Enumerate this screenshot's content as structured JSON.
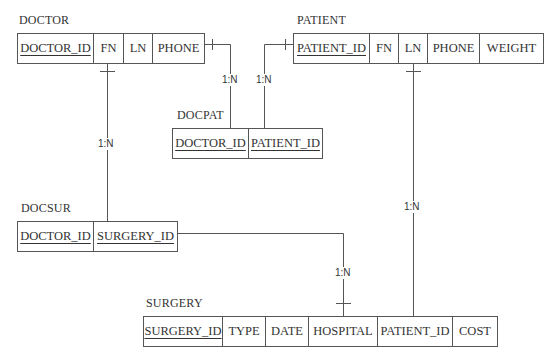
{
  "diagram": {
    "type": "relational-schema",
    "tables": {
      "doctor": {
        "name": "DOCTOR",
        "columns": [
          {
            "label": "DOCTOR_ID",
            "pk": true
          },
          {
            "label": "FN",
            "pk": false
          },
          {
            "label": "LN",
            "pk": false
          },
          {
            "label": "PHONE",
            "pk": false
          }
        ]
      },
      "patient": {
        "name": "PATIENT",
        "columns": [
          {
            "label": "PATIENT_ID",
            "pk": true
          },
          {
            "label": "FN",
            "pk": false
          },
          {
            "label": "LN",
            "pk": false
          },
          {
            "label": "PHONE",
            "pk": false
          },
          {
            "label": "WEIGHT",
            "pk": false
          }
        ]
      },
      "docpat": {
        "name": "DOCPAT",
        "columns": [
          {
            "label": "DOCTOR_ID",
            "pk": true
          },
          {
            "label": "PATIENT_ID",
            "pk": true
          }
        ]
      },
      "docsur": {
        "name": "DOCSUR",
        "columns": [
          {
            "label": "DOCTOR_ID",
            "pk": true
          },
          {
            "label": "SURGERY_ID",
            "pk": true
          }
        ]
      },
      "surgery": {
        "name": "SURGERY",
        "columns": [
          {
            "label": "SURGERY_ID",
            "pk": true
          },
          {
            "label": "TYPE",
            "pk": false
          },
          {
            "label": "DATE",
            "pk": false
          },
          {
            "label": "HOSPITAL",
            "pk": false
          },
          {
            "label": "PATIENT_ID",
            "pk": false
          },
          {
            "label": "COST",
            "pk": false
          }
        ]
      }
    },
    "relationships": [
      {
        "from": "DOCTOR",
        "to": "DOCPAT",
        "cardinality": "1:N"
      },
      {
        "from": "PATIENT",
        "to": "DOCPAT",
        "cardinality": "1:N"
      },
      {
        "from": "DOCTOR",
        "to": "DOCSUR",
        "cardinality": "1:N"
      },
      {
        "from": "SURGERY",
        "to": "DOCSUR",
        "cardinality": "1:N"
      },
      {
        "from": "PATIENT",
        "to": "SURGERY",
        "cardinality": "1:N"
      }
    ]
  },
  "colors": {
    "line": "#555555",
    "text": "#333333",
    "background": "#ffffff"
  }
}
